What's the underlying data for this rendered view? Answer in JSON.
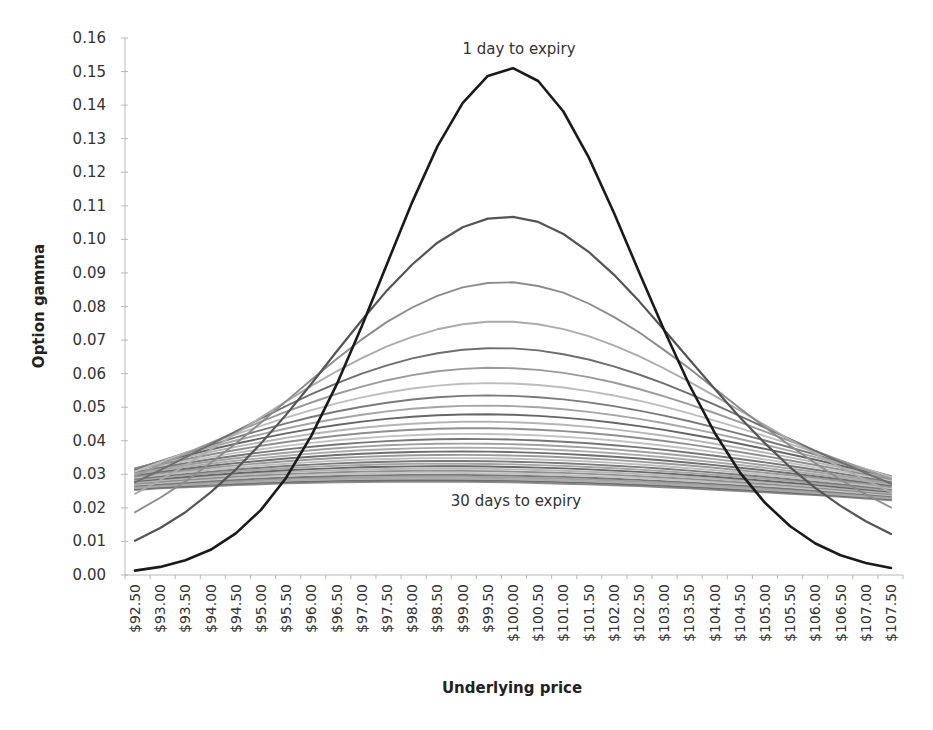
{
  "chart_data": {
    "type": "line",
    "title": "",
    "xlabel": "Underlying price",
    "ylabel": "Option gamma",
    "ylim": [
      0,
      0.16
    ],
    "yticks": [
      "0.00",
      "0.01",
      "0.02",
      "0.03",
      "0.04",
      "0.05",
      "0.06",
      "0.07",
      "0.08",
      "0.09",
      "0.10",
      "0.11",
      "0.12",
      "0.13",
      "0.14",
      "0.15",
      "0.16"
    ],
    "grid": false,
    "legend": "none",
    "categories": [
      "$92.50",
      "$93.00",
      "$93.50",
      "$94.00",
      "$94.50",
      "$95.00",
      "$95.50",
      "$96.00",
      "$96.50",
      "$97.00",
      "$97.50",
      "$98.00",
      "$98.50",
      "$99.00",
      "$99.50",
      "$100.00",
      "$100.50",
      "$101.00",
      "$101.50",
      "$102.00",
      "$102.50",
      "$103.00",
      "$103.50",
      "$104.00",
      "$104.50",
      "$105.00",
      "$105.50",
      "$106.00",
      "$106.50",
      "$107.00",
      "$107.50"
    ],
    "prices": [
      92.5,
      93,
      93.5,
      94,
      94.5,
      95,
      95.5,
      96,
      96.5,
      97,
      97.5,
      98,
      98.5,
      99,
      99.5,
      100,
      100.5,
      101,
      101.5,
      102,
      102.5,
      103,
      103.5,
      104,
      104.5,
      105,
      105.5,
      106,
      106.5,
      107,
      107.5
    ],
    "annotations": [
      {
        "text": "1 day to expiry",
        "near_series": "1 day",
        "position": "above peak"
      },
      {
        "text": "30 days to expiry",
        "near_series": "30 days",
        "position": "below band"
      }
    ],
    "series_model": {
      "description": "Gamma curves for 1..30 days to expiry; strike $100",
      "strike": 100,
      "days": 30,
      "base_sigma_sqrt_t": 0.025,
      "scale": 0.946
    },
    "series": [
      {
        "name": "1 day",
        "days": 1,
        "color": "#1a1a1a",
        "values": [
          0.0013,
          0.0024,
          0.0044,
          0.0075,
          0.0124,
          0.0194,
          0.029,
          0.0415,
          0.0567,
          0.0741,
          0.0927,
          0.1111,
          0.1277,
          0.1406,
          0.1487,
          0.151,
          0.1472,
          0.1381,
          0.1245,
          0.108,
          0.0903,
          0.0729,
          0.0566,
          0.0424,
          0.0306,
          0.0215,
          0.0145,
          0.0094,
          0.0059,
          0.0036,
          0.0021
        ]
      },
      {
        "name": "2 days",
        "days": 2,
        "color": "#555555",
        "values": [
          0.0102,
          0.014,
          0.0187,
          0.0246,
          0.0314,
          0.0392,
          0.0478,
          0.057,
          0.0666,
          0.0759,
          0.0848,
          0.0925,
          0.099,
          0.1036,
          0.1062,
          0.1067,
          0.1052,
          0.1016,
          0.0963,
          0.0895,
          0.0816,
          0.073,
          0.0642,
          0.0555,
          0.047,
          0.0392,
          0.0321,
          0.0259,
          0.0206,
          0.016,
          0.0122
        ]
      },
      {
        "name": "3 days",
        "days": 3,
        "color": "#8c8c8c",
        "values": [
          0.0187,
          0.023,
          0.0279,
          0.0334,
          0.0392,
          0.0454,
          0.0518,
          0.0582,
          0.0644,
          0.0702,
          0.0754,
          0.0797,
          0.0832,
          0.0857,
          0.087,
          0.0872,
          0.0861,
          0.0841,
          0.0809,
          0.0769,
          0.0723,
          0.067,
          0.0615,
          0.0556,
          0.0497,
          0.044,
          0.0385,
          0.0333,
          0.0284,
          0.024,
          0.0201
        ]
      },
      {
        "name": "30 days",
        "days": 30,
        "color": "#8a8a8a",
        "values": [
          0.0253,
          0.0258,
          0.0261,
          0.0264,
          0.0268,
          0.027,
          0.0273,
          0.0275,
          0.0276,
          0.0277,
          0.0278,
          0.0278,
          0.0278,
          0.0278,
          0.0277,
          0.0276,
          0.0274,
          0.0272,
          0.027,
          0.0267,
          0.0265,
          0.0261,
          0.0258,
          0.0254,
          0.025,
          0.0246,
          0.0242,
          0.0238,
          0.0233,
          0.0228,
          0.0223
        ]
      }
    ],
    "series_colors_cycle": [
      "#1a1a1a",
      "#555555",
      "#8c8c8c",
      "#ababab",
      "#6e6e6e",
      "#9a9a9a",
      "#bdbdbd",
      "#7a7a7a",
      "#a5a5a5",
      "#666666",
      "#b5b5b5",
      "#8f8f8f",
      "#c2c2c2",
      "#777777",
      "#a0a0a0"
    ]
  },
  "labels": {
    "annotation_top": "1 day to expiry",
    "annotation_bottom": "30 days to expiry",
    "xlabel": "Underlying price",
    "ylabel": "Option gamma"
  },
  "layout": {
    "plot_left": 125,
    "plot_right": 903,
    "plot_top": 38,
    "plot_bottom": 575,
    "first_x": 135,
    "last_x": 891
  }
}
